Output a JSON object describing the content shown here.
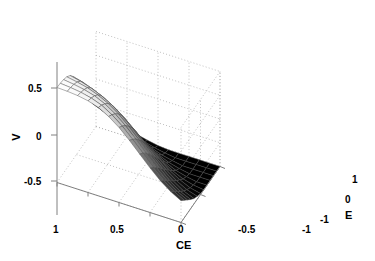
{
  "figure": {
    "type": "surface3d",
    "background": "#ffffff",
    "edge_color": "#4d4d4d",
    "width": 375,
    "height": 261
  },
  "axes": {
    "v": {
      "label": "V",
      "ticks": [
        "0.5",
        "0",
        "-0.5"
      ],
      "tick_values": [
        0.5,
        0,
        -0.5
      ],
      "range": [
        -1,
        1
      ]
    },
    "ce": {
      "label": "CE",
      "ticks": [
        "1",
        "0.5",
        "0",
        "-0.5",
        "-1"
      ],
      "tick_values": [
        1,
        0.5,
        0,
        -0.5,
        -1
      ],
      "range": [
        1,
        -1
      ]
    },
    "e": {
      "label": "E",
      "ticks": [
        "1",
        "0",
        "-1"
      ],
      "tick_values": [
        1,
        0,
        -1
      ],
      "range": [
        -1,
        1
      ]
    }
  },
  "chart_data": {
    "type": "surface",
    "title": "",
    "xlabel": "CE",
    "ylabel": "E",
    "zlabel": "V",
    "xlim": [
      1,
      -1
    ],
    "ylim": [
      -1,
      1
    ],
    "zlim": [
      -1,
      1
    ],
    "grid": true,
    "legend": null,
    "colormap": "gray",
    "x": [
      1,
      0.833,
      0.667,
      0.5,
      0.333,
      0.167,
      0,
      -0.167,
      -0.333,
      -0.5,
      -0.667,
      -0.833,
      -1
    ],
    "y": [
      -1,
      -0.833,
      -0.667,
      -0.5,
      -0.333,
      -0.167,
      0,
      0.167,
      0.333,
      0.5,
      0.667,
      0.833,
      1
    ],
    "z": [
      [
        1.0,
        0.99,
        0.97,
        0.93,
        0.86,
        0.74,
        0.58,
        0.38,
        0.16,
        -0.06,
        -0.26,
        -0.42,
        -0.54
      ],
      [
        0.99,
        0.97,
        0.94,
        0.89,
        0.81,
        0.68,
        0.51,
        0.3,
        0.08,
        -0.15,
        -0.35,
        -0.51,
        -0.63
      ],
      [
        0.97,
        0.94,
        0.9,
        0.84,
        0.74,
        0.6,
        0.42,
        0.21,
        -0.02,
        -0.25,
        -0.45,
        -0.61,
        -0.72
      ],
      [
        0.93,
        0.89,
        0.84,
        0.76,
        0.65,
        0.5,
        0.31,
        0.09,
        -0.14,
        -0.36,
        -0.56,
        -0.71,
        -0.81
      ],
      [
        0.86,
        0.81,
        0.74,
        0.65,
        0.53,
        0.37,
        0.18,
        -0.04,
        -0.27,
        -0.48,
        -0.66,
        -0.8,
        -0.89
      ],
      [
        0.74,
        0.68,
        0.6,
        0.5,
        0.37,
        0.21,
        0.02,
        -0.19,
        -0.4,
        -0.59,
        -0.75,
        -0.87,
        -0.94
      ],
      [
        0.58,
        0.51,
        0.42,
        0.31,
        0.18,
        0.02,
        -0.16,
        -0.35,
        -0.53,
        -0.7,
        -0.83,
        -0.93,
        -0.98
      ],
      [
        0.38,
        0.3,
        0.21,
        0.09,
        -0.04,
        -0.19,
        -0.35,
        -0.52,
        -0.68,
        -0.81,
        -0.91,
        -0.97,
        -1.0
      ],
      [
        0.16,
        0.08,
        -0.02,
        -0.14,
        -0.27,
        -0.4,
        -0.53,
        -0.68,
        -0.8,
        -0.9,
        -0.96,
        -1.0,
        -1.0
      ],
      [
        -0.06,
        -0.15,
        -0.25,
        -0.36,
        -0.48,
        -0.59,
        -0.7,
        -0.81,
        -0.9,
        -0.96,
        -1.0,
        -1.0,
        -1.0
      ],
      [
        -0.26,
        -0.35,
        -0.45,
        -0.56,
        -0.66,
        -0.75,
        -0.83,
        -0.91,
        -0.96,
        -1.0,
        -1.0,
        -1.0,
        -1.0
      ],
      [
        -0.42,
        -0.51,
        -0.61,
        -0.71,
        -0.8,
        -0.87,
        -0.93,
        -0.97,
        -1.0,
        -1.0,
        -1.0,
        -1.0,
        -1.0
      ],
      [
        -0.54,
        -0.63,
        -0.72,
        -0.81,
        -0.89,
        -0.94,
        -0.98,
        -1.0,
        -1.0,
        -1.0,
        -1.0,
        -1.0,
        -1.0
      ]
    ]
  },
  "ticks_rendered": {
    "v_05": "0.5",
    "v_0": "0",
    "v_m05": "-0.5",
    "ce_1": "1",
    "ce_05": "0.5",
    "ce_0": "0",
    "ce_m05": "-0.5",
    "ce_m1": "-1",
    "e_1": "1",
    "e_0": "0",
    "e_m1": "-1"
  }
}
